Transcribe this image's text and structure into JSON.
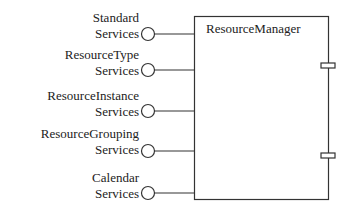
{
  "component": {
    "name": "ResourceManager"
  },
  "interfaces": [
    {
      "line1": "Standard",
      "line2": "Services"
    },
    {
      "line1": "ResourceType",
      "line2": "Services"
    },
    {
      "line1": "ResourceInstance",
      "line2": "Services"
    },
    {
      "line1": "ResourceGrouping",
      "line2": "Services"
    },
    {
      "line1": "Calendar",
      "line2": "Services"
    }
  ],
  "ports": 2,
  "colors": {
    "stroke": "#333333",
    "background": "#ffffff"
  }
}
